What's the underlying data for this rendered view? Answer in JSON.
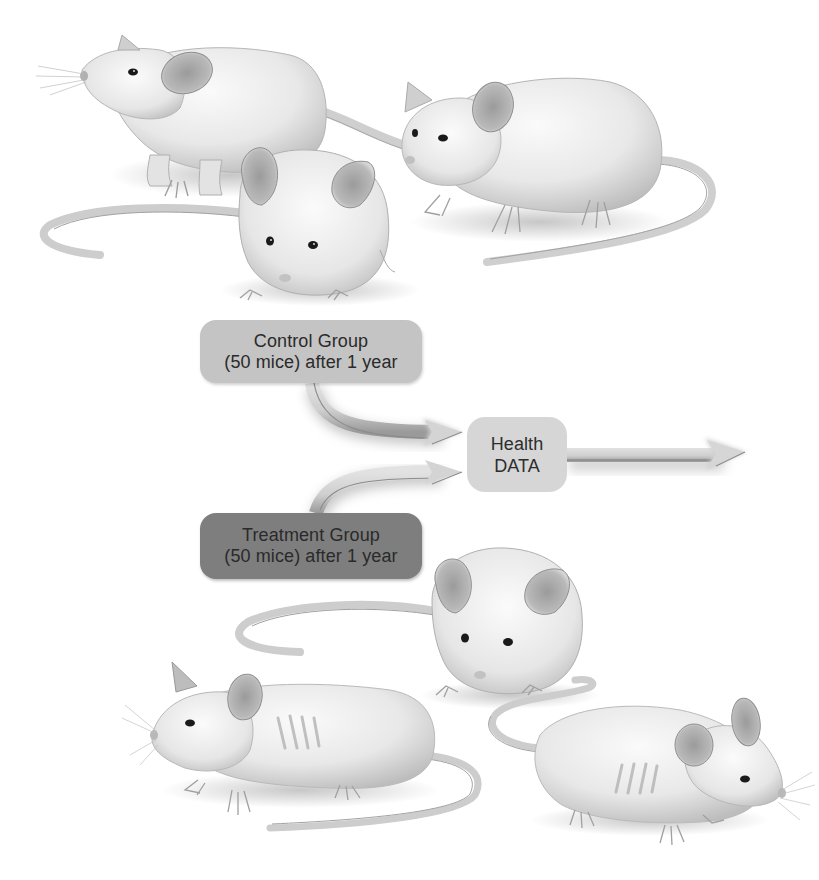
{
  "figure": {
    "type": "experimental-design-illustration",
    "colors": {
      "background": "#ffffff",
      "control_box": "#c4c4c4",
      "treatment_box": "#7e7e7e",
      "health_box": "#d6d6d6",
      "arrow": "#cfcfcf",
      "arrow_shadow": "#8a8a8a",
      "text": "#2a2a2a",
      "mouse_fur": "#ececec",
      "mouse_ear": "#a9a9a9"
    }
  },
  "groups": {
    "control": {
      "title": "Control Group",
      "subtitle": "(50 mice) after 1 year",
      "mice_depicted": 3,
      "condition": "healthy"
    },
    "treatment": {
      "title": "Treatment Group",
      "subtitle": "(50 mice) after 1 year",
      "mice_depicted": 3,
      "condition": "two mice thin with visible ribs"
    }
  },
  "outcome": {
    "line1": "Health",
    "line2": "DATA"
  },
  "arrows": [
    {
      "from": "control",
      "to": "outcome"
    },
    {
      "from": "treatment",
      "to": "outcome"
    },
    {
      "from": "outcome",
      "to": "right-edge"
    }
  ]
}
